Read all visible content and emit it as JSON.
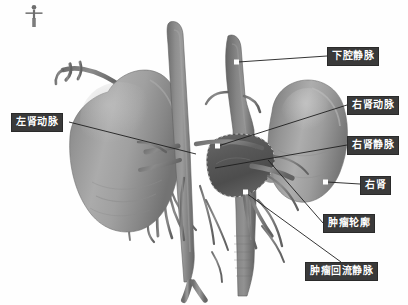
{
  "image": {
    "kind": "3d-medical-render",
    "modality_view": "coronal-anterior",
    "background_color": "#ffffff",
    "organ_color": "#9a9a9a",
    "vessel_color": "#8a8a8a",
    "tumor_color": "#5d5d5d",
    "label_bg_color": "#3a3a3a",
    "label_text_color": "#ffffff",
    "leader_line_color": "#1a1a1a",
    "marker_color": "#ffffff"
  },
  "orientation_figure": {
    "name": "human-body-orientation-icon",
    "visible": true
  },
  "labels": [
    {
      "id": "ivc",
      "text": "下腔静脉",
      "box": {
        "x": 327,
        "y": 47,
        "w": 58,
        "h": 17
      },
      "anchor": {
        "x": 236,
        "y": 63
      },
      "leader_from": {
        "x": 327,
        "y": 56
      }
    },
    {
      "id": "left-renal-artery",
      "text": "左肾动脉",
      "box": {
        "x": 11,
        "y": 113,
        "w": 58,
        "h": 17
      },
      "anchor": {
        "x": 152,
        "y": 148
      },
      "leader_from": {
        "x": 69,
        "y": 122
      }
    },
    {
      "id": "right-renal-artery",
      "text": "右肾动脉",
      "box": {
        "x": 347,
        "y": 96,
        "w": 58,
        "h": 17
      },
      "anchor": {
        "x": 216,
        "y": 146
      },
      "leader_from": {
        "x": 347,
        "y": 105
      }
    },
    {
      "id": "right-renal-vein",
      "text": "右肾静脉",
      "box": {
        "x": 347,
        "y": 136,
        "w": 58,
        "h": 17
      },
      "anchor": {
        "x": 212,
        "y": 166
      },
      "leader_from": {
        "x": 347,
        "y": 145
      }
    },
    {
      "id": "right-kidney",
      "text": "右肾",
      "box": {
        "x": 360,
        "y": 176,
        "w": 34,
        "h": 17
      },
      "anchor": {
        "x": 325,
        "y": 182
      },
      "leader_from": {
        "x": 360,
        "y": 184
      }
    },
    {
      "id": "tumor-outline",
      "text": "肿瘤轮廓",
      "box": {
        "x": 323,
        "y": 214,
        "w": 58,
        "h": 17
      },
      "anchor": {
        "x": 269,
        "y": 163
      },
      "leader_from": {
        "x": 323,
        "y": 223
      }
    },
    {
      "id": "tumor-drainage-vein",
      "text": "肿瘤回流静脉",
      "box": {
        "x": 305,
        "y": 262,
        "w": 82,
        "h": 17
      },
      "anchor": {
        "x": 245,
        "y": 192
      },
      "leader_from": {
        "x": 341,
        "y": 262
      }
    }
  ],
  "markers": [
    {
      "id": "marker-ivc",
      "x": 236,
      "y": 62
    },
    {
      "id": "marker-right-kidney",
      "x": 325,
      "y": 182
    },
    {
      "id": "marker-aorta-mid",
      "x": 217,
      "y": 146
    },
    {
      "id": "marker-tumor",
      "x": 245,
      "y": 192
    }
  ],
  "structures": [
    {
      "id": "left-kidney",
      "name": "左肾",
      "labeled": false
    },
    {
      "id": "right-kidney",
      "name": "右肾",
      "labeled": true
    },
    {
      "id": "aorta",
      "name": "腹主动脉",
      "labeled": false
    },
    {
      "id": "inferior-vena-cava",
      "name": "下腔静脉",
      "labeled": true
    },
    {
      "id": "tumor",
      "name": "肿瘤",
      "labeled": true
    }
  ]
}
